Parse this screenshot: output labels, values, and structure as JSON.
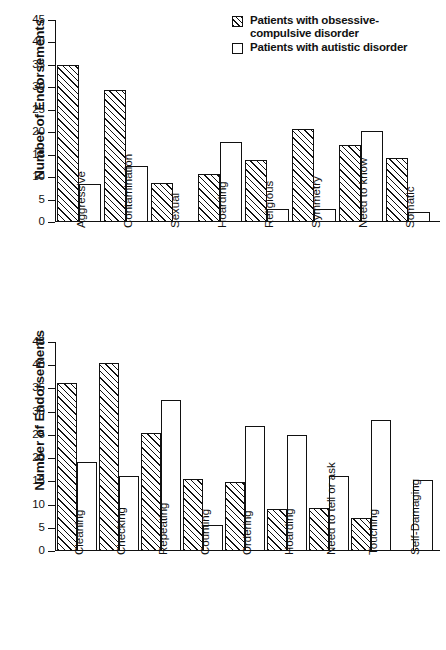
{
  "chart_data": [
    {
      "id": "obsessions",
      "type": "bar",
      "title": "",
      "xlabel": "",
      "ylabel": "Number of Endorsements",
      "ylim": [
        0,
        45
      ],
      "yticks": [
        0,
        5,
        10,
        15,
        20,
        25,
        30,
        35,
        40,
        45
      ],
      "grid": false,
      "legend_position": "top-right",
      "categories": [
        "Aggressive",
        "Contamination",
        "Sexual",
        "Hoarding",
        "Religious",
        "Symmetry",
        "Need to know",
        "Somatic"
      ],
      "series": [
        {
          "name": "Patients with obsessive-compulsive disorder",
          "style": "hatched",
          "values": [
            35,
            29.4,
            8.6,
            10.6,
            13.9,
            20.8,
            17.1,
            14.3
          ]
        },
        {
          "name": "Patients with autistic disorder",
          "style": "open",
          "values": [
            8.4,
            12.4,
            0,
            17.8,
            2.9,
            3.0,
            20.3,
            2.3
          ]
        }
      ]
    },
    {
      "id": "compulsions",
      "type": "bar",
      "title": "",
      "xlabel": "",
      "ylabel": "Number of Endorsements",
      "ylim": [
        0,
        45
      ],
      "yticks": [
        0,
        5,
        10,
        15,
        20,
        25,
        30,
        35,
        40,
        45
      ],
      "grid": false,
      "legend_position": "none",
      "categories": [
        "Cleaning",
        "Checking",
        "Repeating",
        "Counting",
        "Ordering",
        "Hoarding",
        "Need to tell or ask",
        "Touching",
        "Self-Damaging"
      ],
      "series": [
        {
          "name": "Patients with obsessive-compulsive disorder",
          "style": "hatched",
          "values": [
            36.1,
            40.4,
            25.5,
            15.6,
            14.8,
            9.0,
            9.2,
            7.2,
            0
          ]
        },
        {
          "name": "Patients with autistic disorder",
          "style": "open",
          "values": [
            19.2,
            16.2,
            32.6,
            5.6,
            26.9,
            25.0,
            16.1,
            28.3,
            15.3
          ]
        }
      ]
    }
  ],
  "legend": {
    "items": [
      {
        "swatch": "hatched-square-icon",
        "label": "Patients with obsessive-\ncompulsive disorder"
      },
      {
        "swatch": "open-square-icon",
        "label": "Patients with autistic disorder"
      }
    ]
  }
}
